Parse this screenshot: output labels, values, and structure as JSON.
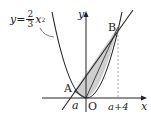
{
  "diagram": {
    "equation": {
      "lhs": "y=",
      "num": "2",
      "den": "3",
      "var": "x",
      "exp": "2"
    },
    "axes": {
      "x_label": "x",
      "y_label": "y",
      "origin_label": "O"
    },
    "points": {
      "A": "A",
      "B": "B"
    },
    "ticks": {
      "a": "a",
      "a_plus_4": "a+4"
    },
    "colors": {
      "curve": "#222222",
      "shade": "#cfcfcf",
      "dashed": "#888888"
    }
  }
}
